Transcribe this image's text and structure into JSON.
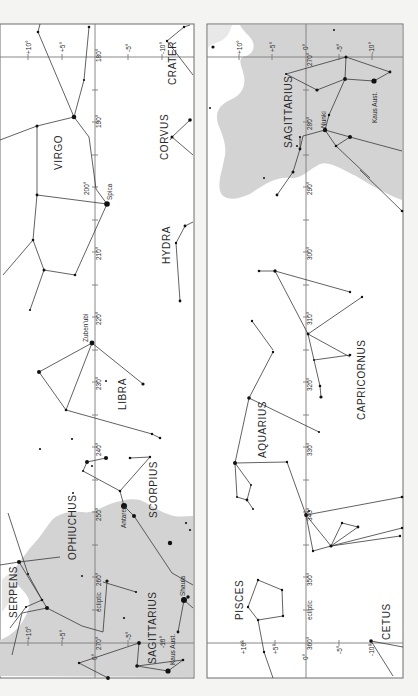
{
  "page": {
    "colors": {
      "paper": "#ffffff",
      "milky_way": "#d3d3d3",
      "lines": "#3a3a3a",
      "grid": "#7a7a7a",
      "background": "#f4f4f2"
    }
  },
  "left_panel": {
    "longitude_labels": [
      "180°",
      "190°",
      "200°",
      "210°",
      "220°",
      "230°",
      "240°",
      "250°",
      "260°",
      "270°"
    ],
    "declination_labels": [
      "+10°",
      "+5°",
      "-5°",
      "-10°",
      "0°"
    ],
    "ecliptic_label": "ecliptic",
    "constellations": [
      "VIRGO",
      "CORVUS",
      "CRATER",
      "HYDRA",
      "LIBRA",
      "SCORPIUS",
      "OPHIUCHUS",
      "SERPENS",
      "SAGITTARIUS"
    ],
    "stars": [
      "Spica",
      "Zuben'ubi",
      "Antares",
      "Shaula",
      "Kaus Aust."
    ]
  },
  "right_panel": {
    "longitude_labels": [
      "270°",
      "280°",
      "290°",
      "300°",
      "310°",
      "320°",
      "330°",
      "340°",
      "350°",
      "360°"
    ],
    "declination_labels": [
      "+10°",
      "+5°",
      "0°",
      "-5°",
      "-10°"
    ],
    "ecliptic_label": "ecliptic",
    "constellations": [
      "SAGITTARIUS",
      "CAPRICORNUS",
      "AQUARIUS",
      "PISCES",
      "CETUS"
    ],
    "stars": [
      "Nunki",
      "Kaus Aust."
    ]
  }
}
